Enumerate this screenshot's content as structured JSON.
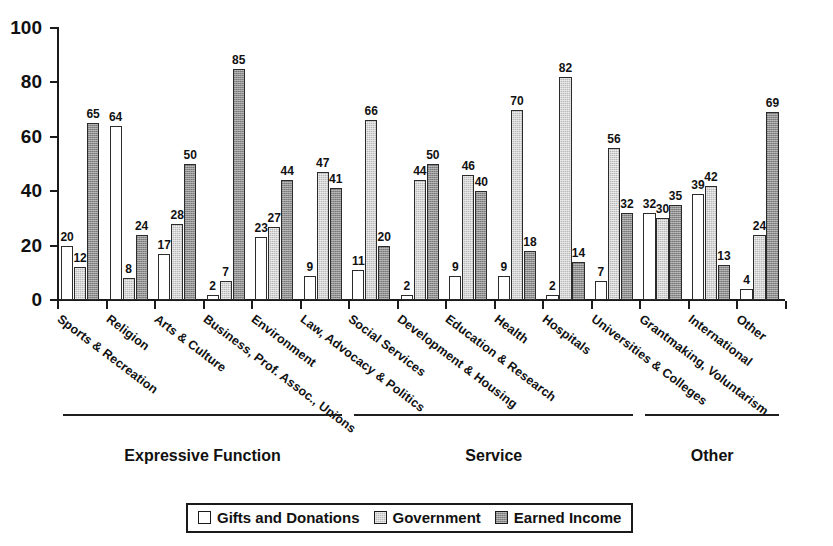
{
  "chart_data": {
    "type": "bar",
    "title": "",
    "subtitle": "",
    "xlabel": "",
    "ylabel": "",
    "ylim": [
      0,
      100
    ],
    "yticks": [
      0,
      20,
      40,
      60,
      80,
      100
    ],
    "grid": false,
    "legend_position": "bottom",
    "value_labels": true,
    "categories": [
      "Sports & Recreation",
      "Religion",
      "Arts & Culture",
      "Business, Prof. Assoc., Unions",
      "Environment",
      "Law, Advocacy & Politics",
      "Social Services",
      "Development & Housing",
      "Education & Research",
      "Health",
      "Hospitals",
      "Universities & Colleges",
      "Grantmaking, Voluntarism",
      "International",
      "Other"
    ],
    "series": [
      {
        "name": "Gifts and Donations",
        "color": "#ffffff",
        "values": [
          20,
          64,
          17,
          2,
          23,
          9,
          11,
          2,
          9,
          9,
          2,
          7,
          32,
          39,
          4
        ]
      },
      {
        "name": "Government",
        "color": "#b9b9b9",
        "values": [
          12,
          8,
          28,
          7,
          27,
          47,
          66,
          44,
          46,
          70,
          82,
          56,
          30,
          42,
          24
        ]
      },
      {
        "name": "Earned Income",
        "color": "#8e8e8e",
        "values": [
          65,
          24,
          50,
          85,
          44,
          41,
          20,
          50,
          40,
          18,
          14,
          32,
          35,
          13,
          69
        ]
      }
    ],
    "sections": [
      {
        "label": "Expressive Function",
        "from_category": 0,
        "to_category": 5
      },
      {
        "label": "Service",
        "from_category": 6,
        "to_category": 11
      },
      {
        "label": "Other",
        "from_category": 12,
        "to_category": 14
      }
    ]
  },
  "legend": {
    "items": [
      {
        "label": "Gifts and Donations",
        "swatch": "white-square-swatch"
      },
      {
        "label": "Government",
        "swatch": "light-gray-square-swatch"
      },
      {
        "label": "Earned Income",
        "swatch": "dark-gray-square-swatch"
      }
    ]
  }
}
